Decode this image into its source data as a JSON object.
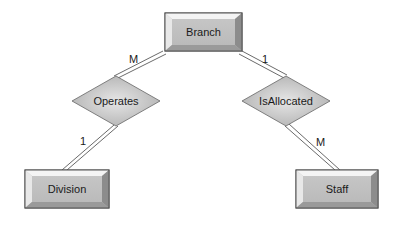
{
  "diagram": {
    "type": "ER diagram",
    "entities": [
      {
        "id": "branch",
        "label": "Branch"
      },
      {
        "id": "division",
        "label": "Division"
      },
      {
        "id": "staff",
        "label": "Staff"
      }
    ],
    "relationships": [
      {
        "id": "operates",
        "label": "Operates"
      },
      {
        "id": "isallocated",
        "label": "IsAllocated"
      }
    ],
    "connections": [
      {
        "from": "branch",
        "to": "operates",
        "cardinality": "M"
      },
      {
        "from": "operates",
        "to": "division",
        "cardinality": "1"
      },
      {
        "from": "branch",
        "to": "isallocated",
        "cardinality": "1"
      },
      {
        "from": "isallocated",
        "to": "staff",
        "cardinality": "M"
      }
    ]
  },
  "colors": {
    "face": "#bdbdbd",
    "bevel_light": "#f2f2f2",
    "bevel_dark": "#8a8a8a",
    "border": "#555555",
    "diamond_fill": "#c4c4c4"
  }
}
